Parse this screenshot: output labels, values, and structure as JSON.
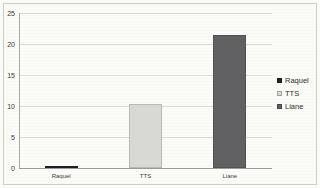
{
  "chart_data": {
    "type": "bar",
    "categories": [
      "Raquel",
      "TTS",
      "Liane"
    ],
    "values": [
      0.2,
      10.3,
      21.4
    ],
    "series_colors": [
      "#23232b",
      "#d9d9d4",
      "#616164"
    ],
    "title": "",
    "xlabel": "",
    "ylabel": "",
    "ylim": [
      0,
      25
    ],
    "yticks": [
      0,
      5,
      10,
      15,
      20,
      25
    ],
    "grid": true,
    "legend": {
      "position": "right",
      "entries": [
        {
          "label": "Raquel",
          "color": "#23232b"
        },
        {
          "label": "TTS",
          "color": "#d9d9d4"
        },
        {
          "label": "Liane",
          "color": "#616164"
        }
      ]
    }
  }
}
